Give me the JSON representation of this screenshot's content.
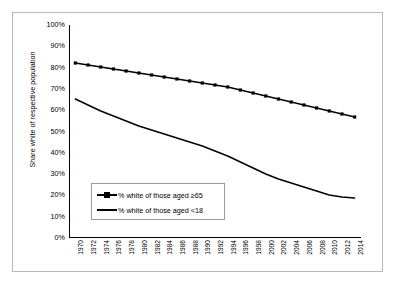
{
  "chart_data": {
    "type": "line",
    "title": "",
    "xlabel": "",
    "ylabel": "Share white of respective population",
    "ylim": [
      0,
      100
    ],
    "ytick_labels": [
      "100%",
      "90%",
      "80%",
      "70%",
      "60%",
      "50%",
      "40%",
      "30%",
      "20%",
      "10%",
      "0%"
    ],
    "ytick_values": [
      100,
      90,
      80,
      70,
      60,
      50,
      40,
      30,
      20,
      10,
      0
    ],
    "grid": false,
    "legend_position": "lower-left-inside",
    "x": [
      1970,
      1972,
      1974,
      1976,
      1978,
      1980,
      1982,
      1984,
      1986,
      1988,
      1990,
      1992,
      1994,
      1996,
      1998,
      2000,
      2002,
      2004,
      2006,
      2008,
      2010,
      2012,
      2014
    ],
    "categories": [
      "1970",
      "1972",
      "1974",
      "1976",
      "1978",
      "1980",
      "1982",
      "1984",
      "1986",
      "1988",
      "1990",
      "1992",
      "1994",
      "1996",
      "1998",
      "2000",
      "2002",
      "2004",
      "2006",
      "2008",
      "2010",
      "2012",
      "2014"
    ],
    "series": [
      {
        "name": "% white of those aged ≥65",
        "marker": "square",
        "color": "#000000",
        "values": [
          88.3,
          87.8,
          87.3,
          86.8,
          86.3,
          85.8,
          85.3,
          84.7,
          84.1,
          83.4,
          82.7,
          81.9,
          81.0,
          80.0,
          79.0,
          77.9,
          76.7,
          75.4,
          74.0,
          72.6,
          71.2,
          69.7,
          68.2
        ]
      },
      {
        "name": "% white of those aged <18",
        "marker": "none",
        "color": "#000000",
        "values": [
          72.0,
          70.0,
          68.0,
          66.2,
          64.5,
          62.8,
          61.2,
          59.6,
          58.0,
          56.4,
          54.8,
          52.6,
          50.2,
          47.6,
          44.8,
          42.0,
          39.6,
          37.4,
          35.4,
          33.6,
          32.0,
          30.8,
          29.9
        ]
      }
    ],
    "series_display": [
      {
        "name": "% white of those aged ≥65",
        "y_px": [
          38,
          40,
          42,
          44,
          46,
          48,
          50,
          52,
          54,
          56,
          58,
          60,
          62,
          65,
          68,
          71,
          74,
          77,
          80,
          83,
          86,
          89,
          92
        ],
        "marker": "square"
      },
      {
        "name": "% white of those aged <18",
        "y_px": [
          74,
          80,
          86,
          91,
          96,
          101,
          105,
          109,
          113,
          117,
          121,
          126,
          131,
          137,
          143,
          149,
          154,
          158,
          162,
          166,
          170,
          172,
          173
        ],
        "marker": "none"
      }
    ]
  },
  "legend": {
    "items": [
      {
        "label": "% white of those aged ≥65"
      },
      {
        "label": "% white of those aged <18"
      }
    ]
  }
}
